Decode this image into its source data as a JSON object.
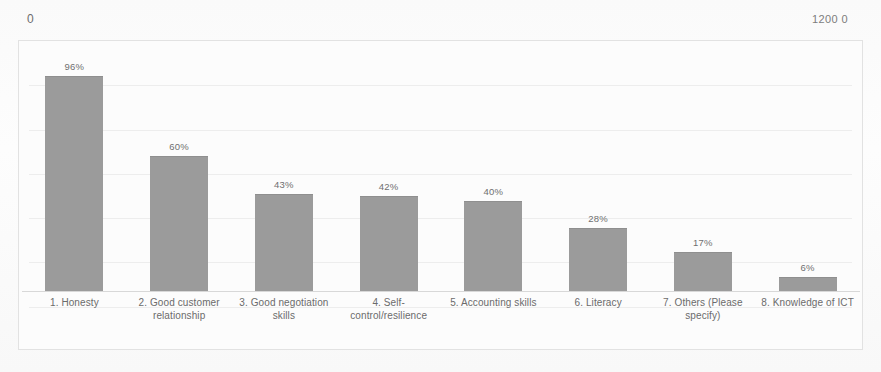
{
  "header": {
    "left_value": "0",
    "right_value": "1200 0"
  },
  "chart_data": {
    "type": "bar",
    "title": "",
    "subtitle": "",
    "xlabel": "",
    "ylabel": "",
    "grid": true,
    "legend": false,
    "ylim": [
      0,
      100
    ],
    "value_suffix": "%",
    "bar_color": "#9b9b9b",
    "categories": [
      "1. Honesty",
      "2. Good customer relationship",
      "3. Good negotiation skills",
      "4. Self-control/resilience",
      "5. Accounting skills",
      "6. Literacy",
      "7. Others (Please specify)",
      "8. Knowledge of ICT"
    ],
    "values": [
      96,
      60,
      43,
      42,
      40,
      28,
      17,
      6
    ],
    "data_labels": [
      "96%",
      "60%",
      "43%",
      "42%",
      "40%",
      "28%",
      "17%",
      "6%"
    ]
  }
}
